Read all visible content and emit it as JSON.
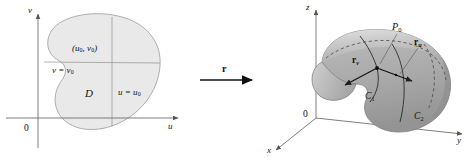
{
  "figure": {
    "colors": {
      "region_fill": "#e9e9e9",
      "region_stroke": "#9a9a9a",
      "surface_light": "#d0d0d0",
      "surface_mid": "#b4b4b4",
      "surface_dark": "#9a9a9a",
      "axis": "#6f6f6f",
      "curve": "#2b2b2b",
      "text": "#111111"
    }
  },
  "left_panel": {
    "name": "uv-parameter-plane",
    "axes": {
      "vertical_label": "v",
      "horizontal_label": "u",
      "origin_label": "0"
    },
    "region_label": "D",
    "point_label": {
      "main": "(u",
      "sub1": "0",
      "mid": ", v",
      "sub2": "0",
      "close": ")"
    },
    "grid_line_v": {
      "text": "v = v",
      "sub": "0"
    },
    "grid_line_u": {
      "text": "u = u",
      "sub": "0"
    }
  },
  "mapping": {
    "name": "mapping-arrow",
    "label": "r"
  },
  "right_panel": {
    "name": "xyz-surface",
    "axes": {
      "z_label": "z",
      "y_label": "y",
      "x_label": "x",
      "origin_label": "0"
    },
    "point_label": {
      "text": "P",
      "sub": "0"
    },
    "tangent_u": {
      "text": "r",
      "sub": "u"
    },
    "tangent_v": {
      "text": "r",
      "sub": "v"
    },
    "curve_1": {
      "text": "C",
      "sub": "1"
    },
    "curve_2": {
      "text": "C",
      "sub": "2"
    }
  }
}
